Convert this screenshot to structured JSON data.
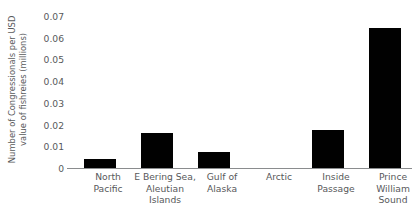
{
  "chart_data": {
    "type": "bar",
    "title": "",
    "xlabel": "",
    "ylabel": "Number of Congressionals per USD value of fishreies (millions)",
    "ylabel_lines": [
      "Number of Congressionals per USD",
      "value of fishreies (millions)"
    ],
    "categories": [
      "North Pacific",
      "E Bering Sea, Aleutian Islands",
      "Gulf of Alaska",
      "Arctic",
      "Inside Passage",
      "Prince William Sound"
    ],
    "category_label_lines": [
      [
        "North",
        "Pacific"
      ],
      [
        "E Bering Sea,",
        "Aleutian",
        "Islands"
      ],
      [
        "Gulf of",
        "Alaska"
      ],
      [
        "Arctic"
      ],
      [
        "Inside",
        "Passage"
      ],
      [
        "Prince",
        "William",
        "Sound"
      ]
    ],
    "values": [
      0.004,
      0.016,
      0.0075,
      0,
      0.0175,
      0.0645
    ],
    "ylim": [
      0,
      0.07
    ],
    "ytick_labels": [
      "0",
      "0.01",
      "0.02",
      "0.03",
      "0.04",
      "0.05",
      "0.06",
      "0.07"
    ],
    "ytick_values": [
      0,
      0.01,
      0.02,
      0.03,
      0.04,
      0.05,
      0.06,
      0.07
    ],
    "grid": false,
    "legend": false,
    "legend_position": "none",
    "bar_color": "#010101",
    "axis_color": "#8a8c8e",
    "text_color": "#58595b",
    "background_color": "#ffffff"
  }
}
